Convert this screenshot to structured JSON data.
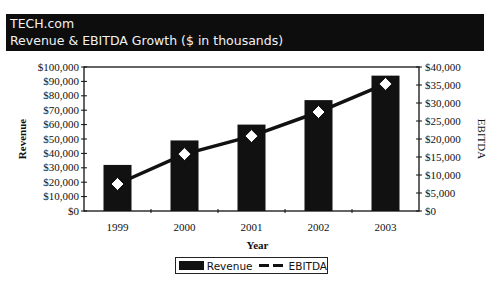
{
  "header": {
    "company": "TECH.com",
    "subtitle": "Revenue & EBITDA Growth ($ in thousands)"
  },
  "legend": {
    "revenue_label": "Revenue",
    "ebitda_label": "EBITDA"
  },
  "axes": {
    "left_title": "Revenue",
    "right_title": "EBITDA",
    "x_title": "Year",
    "left_ticks": [
      "$0",
      "$10,000",
      "$20,000",
      "$30,000",
      "$40,000",
      "$50,000",
      "$60,000",
      "$70,000",
      "$80,000",
      "$90,000",
      "$100,000"
    ],
    "right_ticks": [
      "$0",
      "$5,000",
      "$10,000",
      "$15,000",
      "$20,000",
      "$25,000",
      "$30,000",
      "$35,000",
      "$40,000"
    ]
  },
  "colors": {
    "header_bg": "#0d0d0d",
    "bar": "#111111",
    "line": "#111111",
    "marker": "#ffffff"
  },
  "chart_data": {
    "type": "bar",
    "title": "Revenue & EBITDA Growth ($ in thousands)",
    "xlabel": "Year",
    "ylabel": "Revenue",
    "y2label": "EBITDA",
    "categories": [
      "1999",
      "2000",
      "2001",
      "2002",
      "2003"
    ],
    "series": [
      {
        "name": "Revenue",
        "type": "bar",
        "axis": "left",
        "values": [
          32000,
          49000,
          60000,
          77000,
          94000
        ]
      },
      {
        "name": "EBITDA",
        "type": "line",
        "axis": "right",
        "marker": "diamond",
        "values": [
          7500,
          15800,
          20800,
          27500,
          35300
        ]
      }
    ],
    "ylim": [
      0,
      100000
    ],
    "y2lim": [
      0,
      40000
    ],
    "grid": false,
    "legend_position": "bottom"
  }
}
